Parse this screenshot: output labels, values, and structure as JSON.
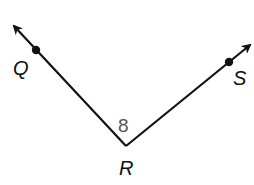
{
  "diagram": {
    "type": "angle",
    "colors": {
      "line": "#111111",
      "angle_label": "#555555",
      "background": "#ffffff"
    },
    "vertex": {
      "label": "R",
      "x": 126,
      "y": 146
    },
    "rays": [
      {
        "name": "ray-RQ",
        "point_label": "Q",
        "point": {
          "x": 36,
          "y": 51
        },
        "arrow_tip": {
          "x": 12,
          "y": 24
        }
      },
      {
        "name": "ray-RS",
        "point_label": "S",
        "point": {
          "x": 229,
          "y": 62
        },
        "arrow_tip": {
          "x": 252,
          "y": 43
        }
      }
    ],
    "angle_label": "8",
    "labels": {
      "Q": "Q",
      "R": "R",
      "S": "S",
      "angle": "8"
    }
  }
}
